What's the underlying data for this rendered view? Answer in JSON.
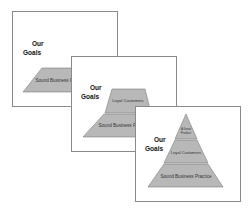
{
  "slides": [
    {
      "title_line1": "Our",
      "title_line2": "Goals",
      "tiers": [
        "Sound Business Practice"
      ]
    },
    {
      "title_line1": "Our",
      "title_line2": "Goals",
      "tiers": [
        "Loyal Customers",
        "Sound Business Practice"
      ]
    },
    {
      "title_line1": "Our",
      "title_line2": "Goals",
      "tiers": [
        "A Great Product",
        "Loyal Customers",
        "Sound Business Practice"
      ]
    }
  ],
  "colors": {
    "tier_fill": "#b8b8b8",
    "tier_stroke": "#7a7a7a",
    "border": "#8a8a8a"
  }
}
